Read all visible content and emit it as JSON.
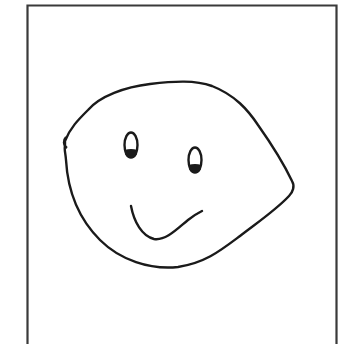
{
  "drawing": {
    "subject": "hand-drawn face",
    "stroke_color": "#1a1a1a",
    "background_color": "#ffffff",
    "frame": {
      "color": "#3a3a3a",
      "left": 26,
      "top": 5,
      "right": 337
    },
    "face": {
      "outline": "lemon-shaped head with a point on the right side"
    },
    "eyes": [
      {
        "name": "left",
        "cx": 131,
        "cy": 145,
        "rx": 7,
        "ry": 13
      },
      {
        "name": "right",
        "cx": 195,
        "cy": 160,
        "rx": 7,
        "ry": 13
      }
    ],
    "mouth": {
      "shape": "lopsided smile"
    }
  }
}
